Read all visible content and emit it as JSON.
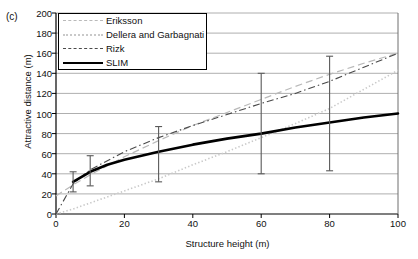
{
  "panel": {
    "label": "(c)"
  },
  "chart_data": {
    "type": "line",
    "title": "",
    "xlabel": "Structure height (m)",
    "ylabel": "Attractive distance (m)",
    "xlim": [
      0,
      100
    ],
    "ylim": [
      0,
      200
    ],
    "xticks": [
      0,
      20,
      40,
      60,
      80,
      100
    ],
    "yticks": [
      0,
      20,
      40,
      60,
      80,
      100,
      120,
      140,
      160,
      180,
      200
    ],
    "grid": "horizontal",
    "legend_position": "top-left",
    "series": [
      {
        "name": "Eriksson",
        "style": "dashed-light",
        "color": "#b9b9b9",
        "x": [
          0,
          5,
          10,
          20,
          30,
          40,
          50,
          60,
          70,
          80,
          90,
          100
        ],
        "y": [
          18,
          29,
          39,
          57,
          73,
          88,
          101,
          114,
          127,
          139,
          150,
          160
        ]
      },
      {
        "name": "Dellera and Garbagnati",
        "style": "dotted",
        "color": "#c9c9c9",
        "x": [
          0,
          5,
          10,
          20,
          30,
          40,
          50,
          60,
          70,
          80,
          90,
          100
        ],
        "y": [
          0,
          5,
          11,
          23,
          35,
          49,
          62,
          76,
          90,
          105,
          124,
          143
        ]
      },
      {
        "name": "Rizk",
        "style": "dash-dot",
        "color": "#4a4a4a",
        "x": [
          0,
          5,
          10,
          20,
          30,
          40,
          50,
          60,
          70,
          80,
          90,
          100
        ],
        "y": [
          0,
          30,
          44,
          62,
          76,
          88,
          99,
          110,
          120,
          132,
          146,
          160
        ]
      },
      {
        "name": "SLIM",
        "style": "solid-thick",
        "color": "#000000",
        "x": [
          5,
          10,
          15,
          20,
          25,
          30,
          40,
          50,
          60,
          70,
          80,
          90,
          100
        ],
        "y": [
          32,
          42,
          49,
          54,
          58,
          62,
          69,
          75,
          80,
          86,
          91,
          96,
          100
        ]
      }
    ],
    "error_bars": [
      {
        "x": 5,
        "y": 32,
        "low": 22,
        "high": 42
      },
      {
        "x": 10,
        "y": 42,
        "low": 28,
        "high": 58
      },
      {
        "x": 30,
        "y": 62,
        "low": 32,
        "high": 87
      },
      {
        "x": 60,
        "y": 80,
        "low": 40,
        "high": 140
      },
      {
        "x": 80,
        "y": 91,
        "low": 43,
        "high": 157
      }
    ]
  }
}
